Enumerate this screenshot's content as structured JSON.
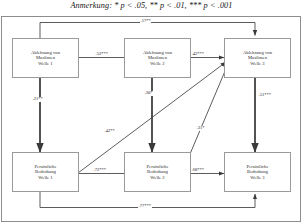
{
  "caption": {
    "prefix": "Anmerkung:",
    "text": "* p < .05, ** p < .01, *** p < .001",
    "full": "Anmerkung: * p < .05, ** p < .01, *** p < .001"
  },
  "diagram": {
    "type": "path-diagram",
    "nodes": [
      {
        "id": "am1",
        "label": "Ablehnung von\nMuslimen\nWelle 1",
        "row": "top",
        "wave": 1
      },
      {
        "id": "am2",
        "label": "Ablehnung von\nMuslimen\nWelle 2",
        "row": "top",
        "wave": 2
      },
      {
        "id": "am3",
        "label": "Ablehnung von\nMuslimen\nWelle 3",
        "row": "top",
        "wave": 3
      },
      {
        "id": "pb1",
        "label": "Persönliche\nBedrohung\nWelle 1",
        "row": "bottom",
        "wave": 1
      },
      {
        "id": "pb2",
        "label": "Persönliche\nBedrohung\nWelle 2",
        "row": "bottom",
        "wave": 2
      },
      {
        "id": "pb3",
        "label": "Persönliche\nBedrohung\nWelle 3",
        "row": "bottom",
        "wave": 3
      }
    ],
    "paths": [
      {
        "id": "p_am1_am2",
        "from": "am1",
        "to": "am2",
        "coef": ".52***",
        "kind": "autoregressive-top"
      },
      {
        "id": "p_am2_am3",
        "from": "am2",
        "to": "am3",
        "coef": ".42***",
        "kind": "autoregressive-top"
      },
      {
        "id": "p_am1_am3",
        "from": "am1",
        "to": "am3",
        "coef": ".17**",
        "kind": "long-top"
      },
      {
        "id": "p_pb1_pb2",
        "from": "pb1",
        "to": "pb2",
        "coef": ".72***",
        "kind": "autoregressive-bottom"
      },
      {
        "id": "p_pb2_pb3",
        "from": "pb2",
        "to": "pb3",
        "coef": ".68***",
        "kind": "autoregressive-bottom"
      },
      {
        "id": "p_pb1_pb3",
        "from": "pb1",
        "to": "pb3",
        "coef": ".77***",
        "kind": "long-bottom"
      },
      {
        "id": "p_am1_pb1",
        "from": "am1",
        "to": "pb1",
        "coef": ".21**",
        "kind": "vertical"
      },
      {
        "id": "p_am2_pb2",
        "from": "am2",
        "to": "pb2",
        "coef": ".30*",
        "kind": "vertical"
      },
      {
        "id": "p_am3_pb3",
        "from": "am3",
        "to": "pb3",
        "coef": ".51***",
        "kind": "vertical"
      },
      {
        "id": "p_pb1_am3",
        "from": "pb1",
        "to": "am3",
        "coef": ".42**",
        "kind": "cross-lagged"
      },
      {
        "id": "p_pb2_am3",
        "from": "pb2",
        "to": "am3",
        "coef": ".31*",
        "kind": "cross-lagged"
      }
    ]
  },
  "style": {
    "line_color": "#4a4a4a",
    "box_border": "#9a9a9a",
    "frame_border": "#8d8d8d",
    "text_color": "#2b2b2b",
    "background": "#ffffff"
  }
}
